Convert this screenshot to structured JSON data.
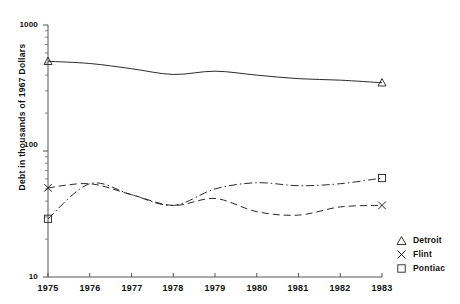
{
  "chart_data": {
    "type": "line",
    "title": "",
    "xlabel": "",
    "ylabel": "Debt in thousands of 1967 Dollars",
    "yscale": "log",
    "ylim": [
      10,
      1000
    ],
    "xlim": [
      1975,
      1983
    ],
    "grid": false,
    "legend_position": "lower-right outside",
    "y_tick_labels": [
      "1000",
      "100",
      "10"
    ],
    "y_tick_values": [
      1000,
      100,
      10
    ],
    "x": [
      1975,
      1976,
      1977,
      1978,
      1979,
      1980,
      1981,
      1982,
      1983
    ],
    "x_tick_labels": [
      "1975",
      "1976",
      "1977",
      "1978",
      "1979",
      "1980",
      "1981",
      "1982",
      "1983"
    ],
    "series": [
      {
        "name": "Detroit",
        "marker": "triangle",
        "linestyle": "solid",
        "color": "#2b2b2b",
        "values": [
          515,
          495,
          450,
          405,
          430,
          400,
          375,
          365,
          348
        ]
      },
      {
        "name": "Flint",
        "marker": "x",
        "linestyle": "dashed",
        "color": "#2b2b2b",
        "values": [
          51,
          55,
          45,
          37,
          42,
          33,
          31,
          36,
          37
        ]
      },
      {
        "name": "Pontiac",
        "marker": "square",
        "linestyle": "dashdot",
        "color": "#2b2b2b",
        "values": [
          29,
          55,
          45,
          37,
          50,
          56,
          53,
          55,
          61
        ]
      }
    ]
  },
  "legend": {
    "items": [
      {
        "label": "Detroit",
        "marker": "triangle-marker"
      },
      {
        "label": "Flint",
        "marker": "x-marker"
      },
      {
        "label": "Pontiac",
        "marker": "square-marker"
      }
    ]
  },
  "axes": {
    "y_title": "Debt in thousands of 1967 Dollars",
    "y_labels": [
      "1000",
      "100",
      "10"
    ],
    "x_labels": [
      "1975",
      "1976",
      "1977",
      "1978",
      "1979",
      "1980",
      "1981",
      "1982",
      "1983"
    ]
  }
}
